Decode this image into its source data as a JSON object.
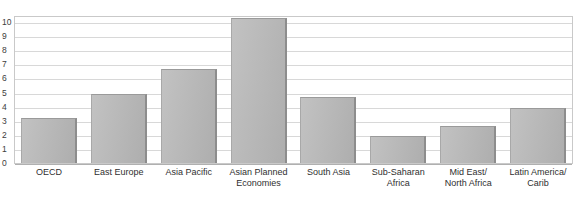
{
  "header": {
    "caption": "% growth rates"
  },
  "chart_data": {
    "type": "bar",
    "title": "",
    "subtitle": "",
    "xlabel": "",
    "ylabel": "% growth rates",
    "ylim": [
      0,
      10.5
    ],
    "grid": true,
    "legend": false,
    "yticks": [
      "10",
      "9",
      "8",
      "7",
      "6",
      "5",
      "4",
      "3",
      "2",
      "1",
      "0"
    ],
    "ytick_values": [
      10,
      9,
      8,
      7,
      6,
      5,
      4,
      3,
      2,
      1,
      0
    ],
    "categories": [
      "OECD",
      "East Europe",
      "Asia Pacific",
      "Asian Planned Economies",
      "South Asia",
      "Sub-Saharan Africa",
      "Mid East/ North Africa",
      "Latin America/ Carib"
    ],
    "category_lines": [
      [
        "OECD"
      ],
      [
        "East Europe"
      ],
      [
        "Asia Pacific"
      ],
      [
        "Asian Planned",
        "Economies"
      ],
      [
        "South Asia"
      ],
      [
        "Sub-Saharan",
        "Africa"
      ],
      [
        "Mid East/",
        "North Africa"
      ],
      [
        "Latin America/",
        "Carib"
      ]
    ],
    "values": [
      3.2,
      4.9,
      6.7,
      10.3,
      4.7,
      1.9,
      2.6,
      3.9
    ],
    "bar_color": "#bcbcbc",
    "grid_color": "#d8d8d8",
    "frame_color": "#c9c9c9",
    "text_color": "#2f2f2f"
  }
}
